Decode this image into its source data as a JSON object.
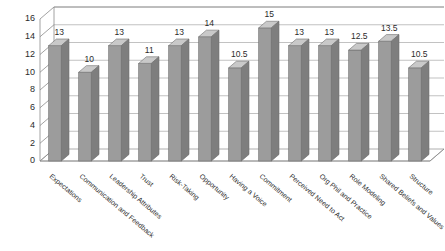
{
  "chart_data": {
    "type": "bar",
    "title": "",
    "subtitle": "",
    "xlabel": "",
    "ylabel": "",
    "ylim": [
      0,
      16
    ],
    "ytick_step": 2,
    "yticks": [
      0,
      2,
      4,
      6,
      8,
      10,
      12,
      14,
      16
    ],
    "grid": true,
    "legend": false,
    "legend_position": "none",
    "three_d": true,
    "data_labels": true,
    "colors": {
      "bar_front": "#9c9c9c",
      "bar_top": "#c9c9c9",
      "bar_side": "#7e7e7e",
      "grid": "#a8a8a8",
      "axis": "#8a8a8a",
      "background": "#ffffff",
      "text": "#2b2b2b"
    },
    "categories": [
      "Expectations",
      "Communication and Feedback",
      "Leadership Attributes",
      "Trust",
      "Risk-Taking",
      "Opportunity",
      "Having a Voice",
      "Commitment",
      "Perceived Need to Act",
      "Org Phil and Practice",
      "Role Modeling",
      "Shared Beliefs and Values",
      "Structure"
    ],
    "values": [
      13,
      10,
      13,
      11,
      13,
      14,
      10.5,
      15,
      13,
      13,
      12.5,
      13.5,
      10.5
    ],
    "value_labels": [
      "13",
      "10",
      "13",
      "11",
      "13",
      "14",
      "10.5",
      "15",
      "13",
      "13",
      "12.5",
      "13.5",
      "10.5"
    ],
    "ytick_labels": [
      "0",
      "2",
      "4",
      "6",
      "8",
      "10",
      "12",
      "14",
      "16"
    ]
  }
}
